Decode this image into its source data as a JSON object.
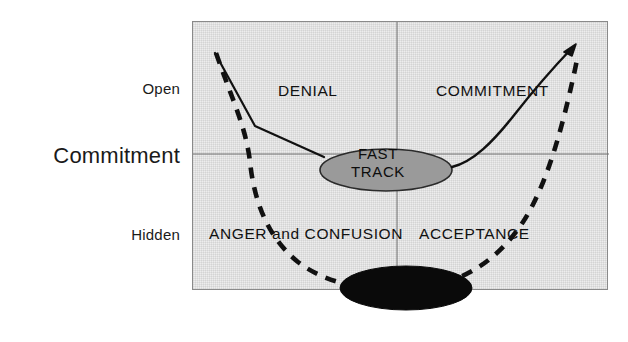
{
  "diagram": {
    "title_label": "Commitment",
    "axis": {
      "vertical_top_label": "Open",
      "vertical_mid_label": "Commitment",
      "vertical_bottom_label": "Hidden"
    },
    "plot_labels": {
      "top_left": "DENIAL",
      "top_right": "COMMITMENT",
      "bottom_left": "ANGER and CONFUSION",
      "bottom_right": "ACCEPTANCE"
    },
    "ellipses": [
      {
        "name": "fast-track",
        "line1": "FAST",
        "line2": "TRACK",
        "fill": "#9a9a9a",
        "stroke": "#2b2b2b"
      },
      {
        "name": "unlabeled-dark",
        "line1": "",
        "line2": "",
        "fill": "#0a0a0a",
        "stroke": "#0a0a0a"
      }
    ],
    "curves": [
      {
        "name": "solid-commitment-curve",
        "style": "solid",
        "color": "#111111",
        "has_arrowhead": true,
        "description": "V-shaped curve descending from upper-left to the fast-track ellipse then rising to upper-right with an arrowhead"
      },
      {
        "name": "dashed-hidden-curve",
        "style": "dashed",
        "color": "#111111",
        "has_arrowhead": false,
        "description": "U-shaped dashed curve plunging from upper-left down to the dark ellipse and back up to the upper-right"
      }
    ],
    "gridlines": {
      "horizontal_color": "#6f6f6f",
      "vertical_color": "#6f6f6f"
    },
    "colors": {
      "plot_background": "#ededed",
      "plot_border": "#8a8a8a",
      "text": "#111111"
    }
  }
}
